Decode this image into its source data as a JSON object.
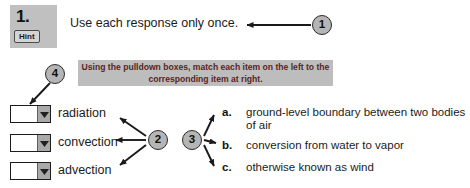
{
  "question": {
    "number": "1.",
    "hint_label": "Hint"
  },
  "top_instruction": "Use each response only once.",
  "callout_bar": {
    "line1": "Using the pulldown boxes, match each item on the left to the",
    "line2": "corresponding item at right."
  },
  "pulldowns": [
    {
      "value": "",
      "placeholder": "",
      "term": "radiation",
      "arrow_icon": "chevron-down-icon"
    },
    {
      "value": "",
      "placeholder": "",
      "term": "convection",
      "arrow_icon": "chevron-down-icon"
    },
    {
      "value": "",
      "placeholder": "",
      "term": "advection",
      "arrow_icon": "chevron-down-icon"
    }
  ],
  "responses": [
    {
      "letter": "a.",
      "text": "ground-level boundary between two bodies of air"
    },
    {
      "letter": "b.",
      "text": "conversion from water to vapor"
    },
    {
      "letter": "c.",
      "text": "otherwise known as wind"
    }
  ],
  "annotations": [
    {
      "id": "1",
      "label": "1"
    },
    {
      "id": "2",
      "label": "2"
    },
    {
      "id": "3",
      "label": "3"
    },
    {
      "id": "4",
      "label": "4"
    }
  ],
  "colors": {
    "page_background": "#ffffff",
    "number_block": "#c0c0c0",
    "callout_bar": "#bdbdbd",
    "callout_text": "#5a2424",
    "annotation_circle": "#b5b5b5",
    "body_text": "#1b1b1b",
    "dropdown_button": "#a9a9a9"
  }
}
